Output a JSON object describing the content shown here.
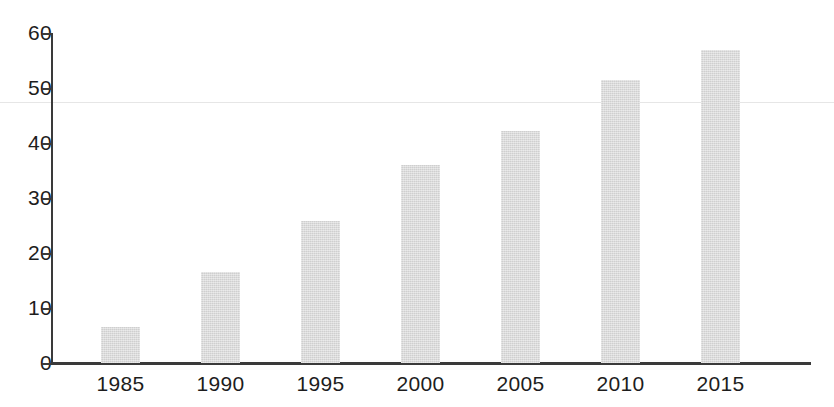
{
  "chart_data": {
    "type": "bar",
    "title": "",
    "subtitle": "",
    "xlabel": "",
    "ylabel": "",
    "categories": [
      "1985",
      "1990",
      "1995",
      "2000",
      "2005",
      "2010",
      "2015"
    ],
    "values": [
      6.5,
      16.5,
      25.8,
      36,
      42.2,
      51.5,
      57
    ],
    "series": [
      {
        "name": "",
        "values": [
          6.5,
          16.5,
          25.8,
          36,
          42.2,
          51.5,
          57
        ]
      }
    ],
    "ylim": [
      0,
      60
    ],
    "xlim_categories": 7,
    "y_ticks": [
      0,
      10,
      20,
      30,
      40,
      50,
      60
    ],
    "y_tick_labels": [
      "0",
      "10",
      "20",
      "30",
      "40",
      "50",
      "60"
    ],
    "x_tick_labels": [
      "1985",
      "1990",
      "1995",
      "2000",
      "2005",
      "2010",
      "2015"
    ],
    "grid": false,
    "legend": null,
    "legend_position": "none",
    "annotations": [],
    "bar_color": "#d8d8d8",
    "axis_color": "#3a3a3a",
    "text_color": "#1d1d1d",
    "background_color": "#ffffff",
    "artifact_line_color": "#e6e6e6",
    "artifact_line_value": 47.5
  },
  "geometry": {
    "baseline_y": 363,
    "axis_x": 51,
    "px_per_unit": 5.5,
    "bar_width": 39,
    "bar_pitch": 100,
    "first_bar_left": 101
  }
}
